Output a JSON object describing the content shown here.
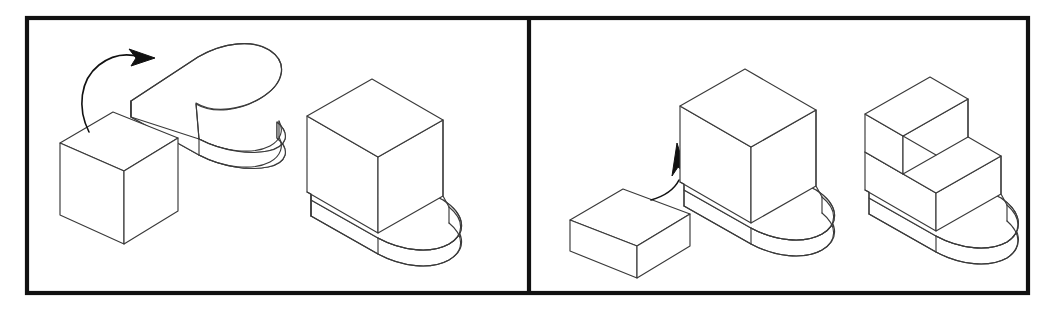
{
  "figure": {
    "type": "mental-rotation-assembly-diagram",
    "background_color": "#ffffff",
    "line_color": "#3a3a3a",
    "frame_color": "#111111",
    "arrow_color": "#111111",
    "panel_count": 2,
    "canvas": {
      "width": 1053,
      "height": 311
    }
  },
  "frame": {
    "outer": {
      "x": 25,
      "y": 16,
      "width": 1005,
      "height": 279,
      "stroke_width": 4
    },
    "divider": {
      "x": 527,
      "y_top": 16,
      "y_bottom": 295,
      "stroke_width": 4
    }
  },
  "panels": [
    {
      "id": "panel-left",
      "name": "left-panel",
      "bounds": {
        "x": 25,
        "y": 16,
        "width": 502,
        "height": 279
      },
      "operation": "rotate-and-place",
      "parts": [
        {
          "id": "left-cube",
          "name": "rectangular-block",
          "shape": "box",
          "description": "small rectangular block at lower-left, isometric view"
        },
        {
          "id": "left-slab",
          "name": "rounded-end-slab",
          "shape": "slab-with-semicircular-end",
          "description": "flat plate with one rounded (semicircular) end, isometric view"
        }
      ],
      "arrow": {
        "id": "left-arrow",
        "name": "rotation-arrow",
        "style": "curved",
        "direction": "clockwise-up-right",
        "description": "curved arc from lower-left sweeping up and to the right with a solid arrowhead"
      },
      "result": {
        "id": "left-result",
        "name": "assembled-solid-one-block",
        "description": "rounded-end slab with one rectangular block standing on its square end"
      }
    },
    {
      "id": "panel-right",
      "name": "right-panel",
      "bounds": {
        "x": 527,
        "y": 16,
        "width": 503,
        "height": 279
      },
      "operation": "translate-and-stack",
      "parts": [
        {
          "id": "right-bar",
          "name": "thin-rectangular-bar",
          "shape": "box",
          "description": "long thin rectangular bar at lower-left, isometric view"
        },
        {
          "id": "right-base",
          "name": "assembled-solid-one-block",
          "shape": "slab-with-block",
          "description": "rounded-end slab with one rectangular block on its square end"
        }
      ],
      "arrow": {
        "id": "right-arrow",
        "name": "translation-arrow",
        "style": "curved",
        "direction": "up",
        "description": "short curved arrow pointing upward into the block"
      },
      "result": {
        "id": "right-result",
        "name": "assembled-solid-stepped",
        "description": "rounded-end slab with a two-level staircase of blocks on its square end"
      }
    }
  ]
}
